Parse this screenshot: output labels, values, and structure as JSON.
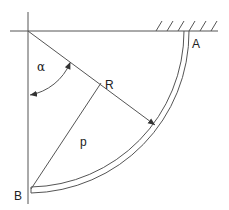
{
  "diagram": {
    "labels": {
      "point_a": "A",
      "point_b": "B",
      "radius": "R",
      "chord": "p",
      "angle": "α"
    },
    "colors": {
      "stroke": "#555555",
      "text": "#222222",
      "background": "#ffffff"
    }
  }
}
